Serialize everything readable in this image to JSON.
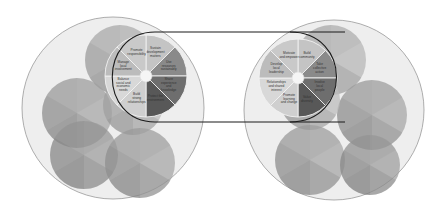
{
  "diagram": {
    "type": "two-cluster-circle-diagram",
    "connector": "oval linking the two highlighted pie wheels",
    "left_cluster": {
      "outer_circle": {
        "cx": 113,
        "cy": 108,
        "r": 91,
        "fill": "#eeeeee"
      },
      "bubbles": [
        {
          "cx": 120,
          "cy": 60,
          "r": 35,
          "fill": "#b8b8b8"
        },
        {
          "cx": 77,
          "cy": 113,
          "r": 35,
          "fill": "#a8a8a8"
        },
        {
          "cx": 133,
          "cy": 105,
          "r": 30,
          "fill": "#bdbdbd"
        },
        {
          "cx": 84,
          "cy": 155,
          "r": 34,
          "fill": "#a0a0a0"
        },
        {
          "cx": 140,
          "cy": 163,
          "r": 35,
          "fill": "#a8a8a8"
        }
      ],
      "wheel": {
        "cx": 146,
        "cy": 76,
        "r": 41,
        "hub_r": 6,
        "segments": [
          {
            "label": "Sustain development matters",
            "fill": "#c4c4c4"
          },
          {
            "label": "Use resources sustainably",
            "fill": "#8a8a8a"
          },
          {
            "label": "Share experience and knowledge",
            "fill": "#6e6e6e"
          },
          {
            "label": "Protect the environment",
            "fill": "#585858"
          },
          {
            "label": "Build strong relationships",
            "fill": "#cfcfcf"
          },
          {
            "label": "Balance social and economic needs",
            "fill": "#d8d8d8"
          },
          {
            "label": "Manage local involvement",
            "fill": "#bcbcbc"
          },
          {
            "label": "Promote responsibility",
            "fill": "#c9c9c9"
          }
        ]
      }
    },
    "right_cluster": {
      "outer_circle": {
        "cx": 334,
        "cy": 110,
        "r": 90,
        "fill": "#eeeeee"
      },
      "bubbles": [
        {
          "cx": 331,
          "cy": 60,
          "r": 35,
          "fill": "#b8b8b8"
        },
        {
          "cx": 372,
          "cy": 115,
          "r": 35,
          "fill": "#a8a8a8"
        },
        {
          "cx": 310,
          "cy": 100,
          "r": 30,
          "fill": "#bdbdbd"
        },
        {
          "cx": 310,
          "cy": 160,
          "r": 35,
          "fill": "#a8a8a8"
        },
        {
          "cx": 370,
          "cy": 165,
          "r": 30,
          "fill": "#a0a0a0"
        }
      ],
      "wheel": {
        "cx": 298,
        "cy": 78,
        "r": 39,
        "hub_r": 6,
        "segments": [
          {
            "label": "Build community",
            "fill": "#c4c4c4"
          },
          {
            "label": "Take collective action",
            "fill": "#8a8a8a"
          },
          {
            "label": "Involve local people",
            "fill": "#6e6e6e"
          },
          {
            "label": "Value diversity",
            "fill": "#585858"
          },
          {
            "label": "Promote learning and change",
            "fill": "#cfcfcf"
          },
          {
            "label": "Relationships and shared interest",
            "fill": "#d8d8d8"
          },
          {
            "label": "Develop local leadership",
            "fill": "#bcbcbc"
          },
          {
            "label": "Motivate and empower",
            "fill": "#c9c9c9"
          }
        ]
      }
    },
    "colors": {
      "outline": "#1a1a1a",
      "outer_stroke": "#999999",
      "divider": "#f2f2f2",
      "hub": "#f5f5f5",
      "label_text": "#333333"
    }
  }
}
